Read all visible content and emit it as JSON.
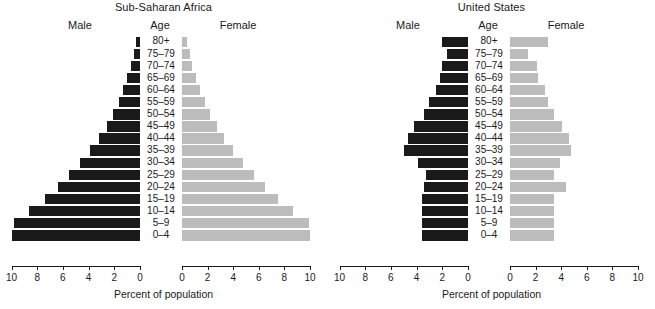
{
  "figure": {
    "xlabel": "Percent of population",
    "col_headers": {
      "male": "Male",
      "age": "Age",
      "female": "Female"
    },
    "age_groups": [
      "80+",
      "75–79",
      "70–74",
      "65–69",
      "60–64",
      "55–59",
      "50–54",
      "45–49",
      "40–44",
      "35–39",
      "30–34",
      "25–29",
      "20–24",
      "15–19",
      "10–14",
      "5–9",
      "0–4"
    ],
    "tick_labels_left": [
      "10",
      "8",
      "6",
      "4",
      "2",
      "0"
    ],
    "tick_labels_right": [
      "0",
      "2",
      "4",
      "6",
      "8",
      "10"
    ],
    "colors": {
      "male_bar": "#1a1a1a",
      "female_bar": "#bcbcbc",
      "axis": "#1a1a1a",
      "background": "#ffffff"
    }
  },
  "chart_data": [
    {
      "type": "bar",
      "title": "Sub-Saharan Africa",
      "orientation": "horizontal-population-pyramid",
      "xlabel": "Percent of population",
      "ylabel": "Age",
      "xlim": [
        0,
        10
      ],
      "grid": false,
      "legend": "none",
      "categories": [
        "80+",
        "75–79",
        "70–74",
        "65–69",
        "60–64",
        "55–59",
        "50–54",
        "45–49",
        "40–44",
        "35–39",
        "30–34",
        "25–29",
        "20–24",
        "15–19",
        "10–14",
        "5–9",
        "0–4"
      ],
      "series": [
        {
          "name": "Male",
          "side": "left",
          "values": [
            0.3,
            0.5,
            0.7,
            1.0,
            1.3,
            1.6,
            2.1,
            2.6,
            3.2,
            3.9,
            4.7,
            5.5,
            6.4,
            7.4,
            8.6,
            9.8,
            11.1
          ]
        },
        {
          "name": "Female",
          "side": "right",
          "values": [
            0.4,
            0.6,
            0.8,
            1.1,
            1.4,
            1.8,
            2.2,
            2.7,
            3.3,
            4.0,
            4.8,
            5.6,
            6.5,
            7.5,
            8.7,
            9.9,
            11.2
          ]
        }
      ]
    },
    {
      "type": "bar",
      "title": "United States",
      "orientation": "horizontal-population-pyramid",
      "xlabel": "Percent of population",
      "ylabel": "Age",
      "xlim": [
        0,
        10
      ],
      "grid": false,
      "legend": "none",
      "categories": [
        "80+",
        "75–79",
        "70–74",
        "65–69",
        "60–64",
        "55–59",
        "50–54",
        "45–49",
        "40–44",
        "35–39",
        "30–34",
        "25–29",
        "20–24",
        "15–19",
        "10–14",
        "5–9",
        "0–4"
      ],
      "series": [
        {
          "name": "Male",
          "side": "left",
          "values": [
            2.0,
            1.6,
            2.0,
            2.2,
            2.5,
            3.0,
            3.4,
            4.2,
            4.7,
            5.0,
            3.9,
            3.3,
            3.4,
            3.6,
            3.6,
            3.6,
            3.6
          ]
        },
        {
          "name": "Female",
          "side": "right",
          "values": [
            3.0,
            1.4,
            2.1,
            2.2,
            2.7,
            3.0,
            3.4,
            4.1,
            4.6,
            4.8,
            3.9,
            3.4,
            4.4,
            3.4,
            3.4,
            3.4,
            3.4
          ]
        }
      ]
    }
  ]
}
